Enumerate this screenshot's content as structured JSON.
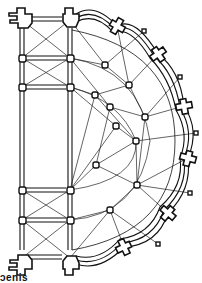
{
  "diagram": {
    "type": "architectural-floor-plan",
    "caption": "ɔenis",
    "colors": {
      "ink": "#111111",
      "background": "#ffffff"
    },
    "piers_nave": [
      {
        "x": 22,
        "y": 20,
        "kind": "compound"
      },
      {
        "x": 70,
        "y": 20,
        "kind": "compound"
      },
      {
        "x": 22,
        "y": 58,
        "kind": "column"
      },
      {
        "x": 70,
        "y": 58,
        "kind": "column"
      },
      {
        "x": 22,
        "y": 87,
        "kind": "column"
      },
      {
        "x": 70,
        "y": 87,
        "kind": "column"
      },
      {
        "x": 22,
        "y": 190,
        "kind": "column"
      },
      {
        "x": 70,
        "y": 190,
        "kind": "column"
      },
      {
        "x": 22,
        "y": 220,
        "kind": "column"
      },
      {
        "x": 70,
        "y": 220,
        "kind": "column"
      },
      {
        "x": 22,
        "y": 258,
        "kind": "compound"
      },
      {
        "x": 70,
        "y": 258,
        "kind": "compound"
      }
    ],
    "ambulatory_inner_columns": [
      {
        "x": 95,
        "y": 95
      },
      {
        "x": 105,
        "y": 65
      },
      {
        "x": 129,
        "y": 85
      },
      {
        "x": 110,
        "y": 107
      },
      {
        "x": 145,
        "y": 117
      },
      {
        "x": 116,
        "y": 126
      },
      {
        "x": 137,
        "y": 185
      },
      {
        "x": 110,
        "y": 210
      },
      {
        "x": 96,
        "y": 165
      },
      {
        "x": 136,
        "y": 141
      }
    ],
    "chapel_buttresses": [
      {
        "x": 117,
        "y": 26,
        "angle": -60
      },
      {
        "x": 158,
        "y": 54,
        "angle": -35
      },
      {
        "x": 184,
        "y": 106,
        "angle": -10
      },
      {
        "x": 188,
        "y": 158,
        "angle": 15
      },
      {
        "x": 168,
        "y": 213,
        "angle": 40
      },
      {
        "x": 124,
        "y": 247,
        "angle": 65
      }
    ],
    "chapel_outer_columns": [
      {
        "x": 144,
        "y": 31
      },
      {
        "x": 180,
        "y": 77
      },
      {
        "x": 196,
        "y": 133
      },
      {
        "x": 190,
        "y": 193
      },
      {
        "x": 158,
        "y": 244
      }
    ]
  }
}
